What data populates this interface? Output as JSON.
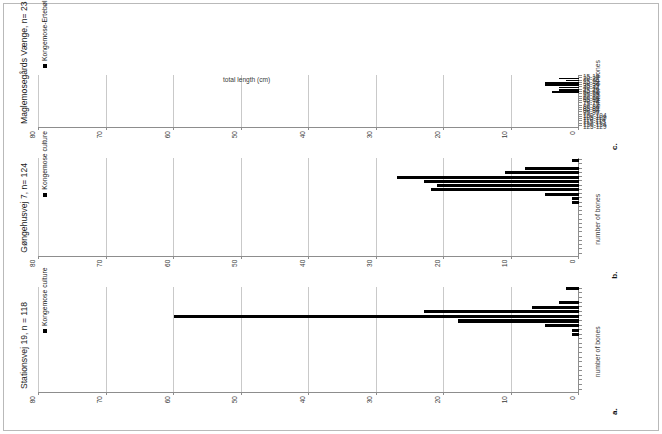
{
  "figure": {
    "categories": [
      "15-19",
      "20-24",
      "25-29",
      "30-34",
      "35-39",
      "40-44",
      "45-49",
      "50-54",
      "55-59",
      "60-64",
      "65-69",
      "70-74",
      "75-79",
      "80-84",
      "85-89",
      "90-94",
      "95-99",
      "100-104",
      "105-109",
      "110-114",
      "115-119",
      "120-124",
      "125-129"
    ],
    "category_axis_title": "total length (cm)",
    "value_axis_title": "number of bones",
    "value_ticks": [
      "0",
      "10",
      "20",
      "30",
      "40",
      "50",
      "60",
      "70",
      "80"
    ],
    "value_max": 80,
    "colors": {
      "bar": "#000000",
      "grid": "#c9c9c9",
      "axis": "#8d8d8d",
      "text": "#1a1a1a"
    }
  },
  "panels": [
    {
      "letter": "a.",
      "title": "Stationsvej 19, n = 118",
      "legend": "Kongemose culture",
      "legend_marker": "filled-square",
      "values": [
        2,
        0,
        0,
        3,
        7,
        23,
        60,
        18,
        5,
        1,
        1,
        0,
        0,
        0,
        0,
        0,
        0,
        0,
        0,
        0,
        0,
        0,
        0
      ]
    },
    {
      "letter": "b.",
      "title": "Gøngehusvej 7, n= 124",
      "legend": "Kongemose culture",
      "legend_marker": "filled-square",
      "values": [
        1,
        0,
        8,
        11,
        27,
        23,
        21,
        22,
        5,
        1,
        1,
        0,
        0,
        0,
        0,
        0,
        0,
        0,
        0,
        0,
        0,
        0,
        0
      ]
    },
    {
      "letter": "c.",
      "title": "Maglemosegårds Vænge, n= 23",
      "legend": "Kongemose-Ertebølle transition",
      "legend_marker": "filled-square",
      "values": [
        0,
        3,
        2,
        5,
        5,
        3,
        3,
        4,
        0,
        0,
        0,
        0,
        0,
        0,
        0,
        0,
        0,
        0,
        0,
        0,
        0,
        0,
        0
      ]
    }
  ],
  "chart_data": {
    "type": "bar",
    "title": "",
    "orientation": "horizontal-rotated",
    "categories": [
      "15-19",
      "20-24",
      "25-29",
      "30-34",
      "35-39",
      "40-44",
      "45-49",
      "50-54",
      "55-59",
      "60-64",
      "65-69",
      "70-74",
      "75-79",
      "80-84",
      "85-89",
      "90-94",
      "95-99",
      "100-104",
      "105-109",
      "110-114",
      "115-119",
      "120-124",
      "125-129"
    ],
    "xlabel": "total length (cm)",
    "ylabel": "number of bones",
    "ylim": [
      0,
      80
    ],
    "yticks": [
      0,
      10,
      20,
      30,
      40,
      50,
      60,
      70,
      80
    ],
    "grid": true,
    "legend_position": "inside-top-left",
    "series": [
      {
        "name": "Stationsvej 19, n = 118",
        "panel": "a.",
        "legend": "Kongemose culture",
        "values": [
          2,
          0,
          0,
          3,
          7,
          23,
          60,
          18,
          5,
          1,
          1,
          0,
          0,
          0,
          0,
          0,
          0,
          0,
          0,
          0,
          0,
          0,
          0
        ]
      },
      {
        "name": "Gøngehusvej 7, n= 124",
        "panel": "b.",
        "legend": "Kongemose culture",
        "values": [
          1,
          0,
          8,
          11,
          27,
          23,
          21,
          22,
          5,
          1,
          1,
          0,
          0,
          0,
          0,
          0,
          0,
          0,
          0,
          0,
          0,
          0,
          0
        ]
      },
      {
        "name": "Maglemosegårds Vænge, n= 23",
        "panel": "c.",
        "legend": "Kongemose-Ertebølle transition",
        "values": [
          0,
          3,
          2,
          5,
          5,
          3,
          3,
          4,
          0,
          0,
          0,
          0,
          0,
          0,
          0,
          0,
          0,
          0,
          0,
          0,
          0,
          0,
          0
        ]
      }
    ]
  }
}
